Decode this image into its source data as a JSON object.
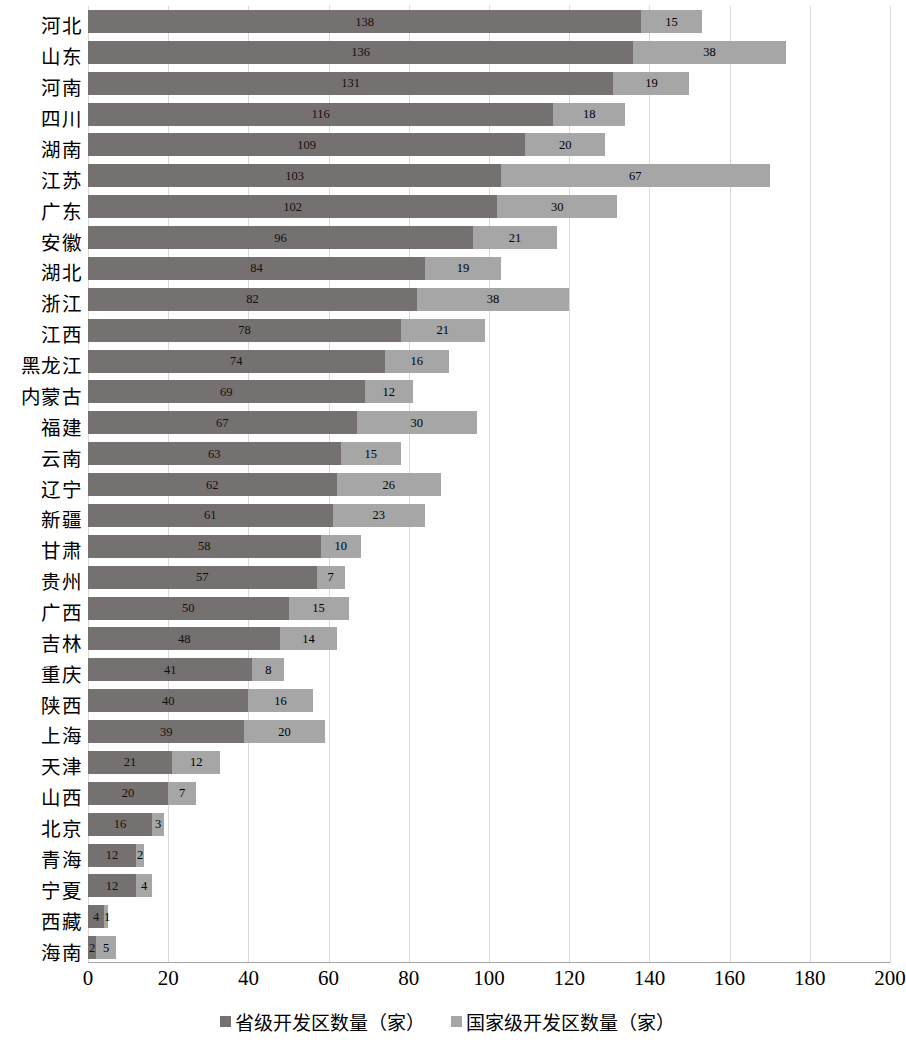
{
  "chart_data": {
    "type": "bar",
    "orientation": "horizontal",
    "stacked": true,
    "title": "",
    "xlabel": "",
    "ylabel": "",
    "xlim": [
      0,
      200
    ],
    "xticks": [
      0,
      20,
      40,
      60,
      80,
      100,
      120,
      140,
      160,
      180,
      200
    ],
    "grid": "vertical",
    "legend_position": "bottom",
    "categories": [
      "河北",
      "山东",
      "河南",
      "四川",
      "湖南",
      "江苏",
      "广东",
      "安徽",
      "湖北",
      "浙江",
      "江西",
      "黑龙江",
      "内蒙古",
      "福建",
      "云南",
      "辽宁",
      "新疆",
      "甘肃",
      "贵州",
      "广西",
      "吉林",
      "重庆",
      "陕西",
      "上海",
      "天津",
      "山西",
      "北京",
      "青海",
      "宁夏",
      "西藏",
      "海南"
    ],
    "series": [
      {
        "name": "省级开发区数量（家）",
        "color": "#767171",
        "values": [
          138,
          136,
          131,
          116,
          109,
          103,
          102,
          96,
          84,
          82,
          78,
          74,
          69,
          67,
          63,
          62,
          61,
          58,
          57,
          50,
          48,
          41,
          40,
          39,
          21,
          20,
          16,
          12,
          12,
          4,
          2
        ]
      },
      {
        "name": "国家级开发区数量（家）",
        "color": "#a6a6a6",
        "values": [
          15,
          38,
          19,
          18,
          20,
          67,
          30,
          21,
          19,
          38,
          21,
          16,
          12,
          30,
          15,
          26,
          23,
          10,
          7,
          15,
          14,
          8,
          16,
          20,
          12,
          7,
          3,
          2,
          4,
          1,
          5
        ]
      }
    ]
  },
  "legend": {
    "items": [
      {
        "label": "省级开发区数量（家）",
        "color": "#767171"
      },
      {
        "label": "国家级开发区数量（家）",
        "color": "#a6a6a6"
      }
    ]
  }
}
